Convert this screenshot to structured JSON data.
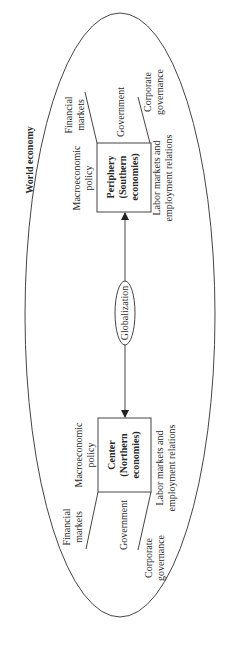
{
  "diagram": {
    "title": "World economy",
    "center_label": "Globalization",
    "orientation": "rotated -90deg (text reads bottom-to-top)",
    "nodes": {
      "periphery": {
        "line1": "Periphery",
        "line2": "(Southern",
        "line3": "economies)",
        "surrounding": {
          "macro": [
            "Macroeconomic",
            "policy"
          ],
          "financial": [
            "Financial",
            "markets"
          ],
          "government": "Government",
          "corporate": [
            "Corporate",
            "governance"
          ],
          "labor": [
            "Labor markets and",
            "employment relations"
          ]
        }
      },
      "center": {
        "line1": "Center",
        "line2": "(Northern",
        "line3": "economies)",
        "surrounding": {
          "macro": [
            "Macroeconomic",
            "policy"
          ],
          "financial": [
            "Financial",
            "markets"
          ],
          "government": "Government",
          "corporate": [
            "Corporate",
            "governance"
          ],
          "labor": [
            "Labor markets and",
            "employment relations"
          ]
        }
      }
    },
    "edges": [
      {
        "from": "globalization",
        "to": "periphery",
        "type": "arrow"
      },
      {
        "from": "globalization",
        "to": "center",
        "type": "arrow"
      }
    ],
    "colors": {
      "stroke": "#444444",
      "text": "#2a2a2a",
      "background": "#ffffff"
    }
  }
}
